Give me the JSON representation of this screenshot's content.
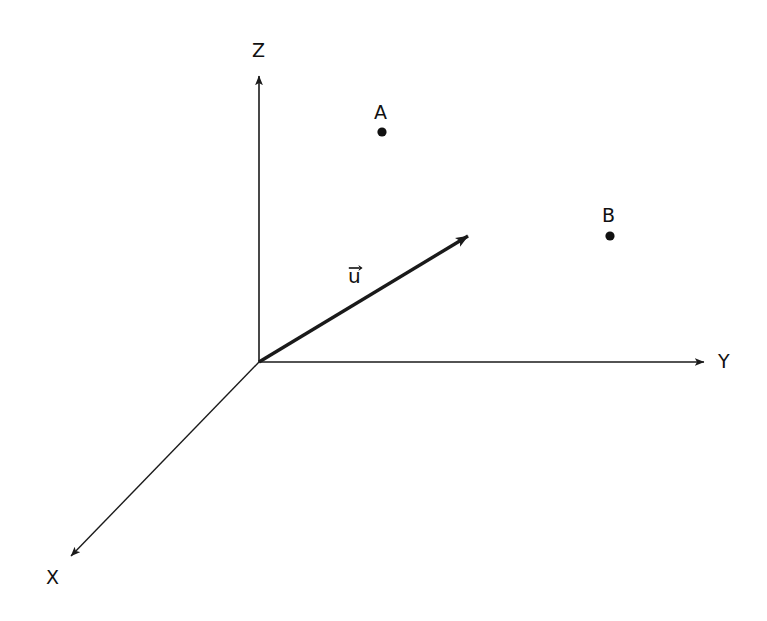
{
  "canvas": {
    "width": 767,
    "height": 621,
    "background": "#ffffff",
    "stroke_color": "#1a1a1a"
  },
  "figure": {
    "type": "3d-coordinate-axes-diagram",
    "origin": {
      "x": 259,
      "y": 362
    }
  },
  "axes": [
    {
      "id": "z",
      "label": "Z",
      "from": {
        "x": 259,
        "y": 362
      },
      "to": {
        "x": 259,
        "y": 68
      },
      "label_pos": {
        "x": 259,
        "y": 51
      },
      "stroke_width": 1.6,
      "arrow": true
    },
    {
      "id": "y",
      "label": "Y",
      "from": {
        "x": 259,
        "y": 362
      },
      "to": {
        "x": 712,
        "y": 362
      },
      "label_pos": {
        "x": 723,
        "y": 362
      },
      "stroke_width": 1.6,
      "arrow": true
    },
    {
      "id": "x",
      "label": "X",
      "from": {
        "x": 259,
        "y": 362
      },
      "to": {
        "x": 65,
        "y": 562
      },
      "label_pos": {
        "x": 55,
        "y": 578
      },
      "stroke_width": 1.4,
      "arrow": true
    }
  ],
  "vectors": [
    {
      "id": "u",
      "label": "u",
      "label_notation": "arrow-over",
      "from": {
        "x": 259,
        "y": 362
      },
      "to": {
        "x": 478,
        "y": 230
      },
      "label_pos": {
        "x": 358,
        "y": 282
      },
      "stroke_width": 3.4,
      "arrow": true
    }
  ],
  "points": [
    {
      "id": "A",
      "label": "A",
      "pos": {
        "x": 382,
        "y": 132
      },
      "label_pos": {
        "x": 381,
        "y": 113
      },
      "radius": 4.6
    },
    {
      "id": "B",
      "label": "B",
      "pos": {
        "x": 610,
        "y": 236
      },
      "label_pos": {
        "x": 609,
        "y": 216
      },
      "radius": 4.6
    }
  ]
}
